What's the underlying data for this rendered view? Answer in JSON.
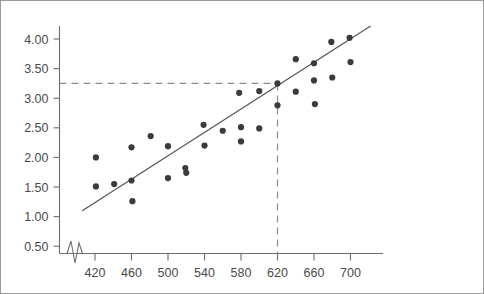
{
  "chart_data": {
    "type": "scatter",
    "title": "",
    "subtitle": "",
    "xlabel": "",
    "ylabel": "",
    "xlim": [
      400,
      716
    ],
    "ylim": [
      0.25,
      4.25
    ],
    "xticks": [
      420,
      460,
      500,
      540,
      580,
      620,
      660,
      700
    ],
    "yticks": [
      0.5,
      1.0,
      1.5,
      2.0,
      2.5,
      3.0,
      3.5,
      4.0
    ],
    "xtick_labels": [
      "420",
      "460",
      "500",
      "540",
      "580",
      "620",
      "660",
      "700"
    ],
    "ytick_labels": [
      "0.50",
      "1.00",
      "1.50",
      "2.00",
      "2.50",
      "3.00",
      "3.50",
      "4.00"
    ],
    "grid": false,
    "legend": null,
    "axis_break_x": true,
    "points": [
      {
        "x": 421,
        "y": 2.0
      },
      {
        "x": 421,
        "y": 1.51
      },
      {
        "x": 441,
        "y": 1.55
      },
      {
        "x": 460,
        "y": 2.17
      },
      {
        "x": 460,
        "y": 1.61
      },
      {
        "x": 461,
        "y": 1.26
      },
      {
        "x": 481,
        "y": 2.36
      },
      {
        "x": 500,
        "y": 2.19
      },
      {
        "x": 500,
        "y": 1.65
      },
      {
        "x": 519,
        "y": 1.82
      },
      {
        "x": 520,
        "y": 1.74
      },
      {
        "x": 539,
        "y": 2.55
      },
      {
        "x": 540,
        "y": 2.2
      },
      {
        "x": 560,
        "y": 2.45
      },
      {
        "x": 578,
        "y": 3.09
      },
      {
        "x": 580,
        "y": 2.51
      },
      {
        "x": 580,
        "y": 2.27
      },
      {
        "x": 600,
        "y": 3.12
      },
      {
        "x": 600,
        "y": 2.49
      },
      {
        "x": 620,
        "y": 3.25
      },
      {
        "x": 620,
        "y": 2.88
      },
      {
        "x": 640,
        "y": 3.66
      },
      {
        "x": 640,
        "y": 3.11
      },
      {
        "x": 660,
        "y": 3.59
      },
      {
        "x": 660,
        "y": 3.3
      },
      {
        "x": 661,
        "y": 2.9
      },
      {
        "x": 679,
        "y": 3.95
      },
      {
        "x": 680,
        "y": 3.35
      },
      {
        "x": 699,
        "y": 4.02
      },
      {
        "x": 700,
        "y": 3.61
      }
    ],
    "regression_line": {
      "x_start": 406,
      "y_start": 1.1,
      "x_end": 722,
      "y_end": 4.22
    },
    "reference_lines": [
      {
        "orientation": "horizontal",
        "value": 3.25,
        "style": "dashed",
        "from_x": 400,
        "to_x": 620
      },
      {
        "orientation": "vertical",
        "value": 620,
        "style": "dashed",
        "from_y": 0.25,
        "to_y": 3.25
      }
    ]
  },
  "colors": {
    "point": "#3b3b3b",
    "regression": "#555555",
    "guide": "#8d8d8d",
    "axis": "#6e6e6e",
    "label": "#4a4a4a",
    "frame": "#9a9a9a",
    "background": "#ffffff"
  }
}
